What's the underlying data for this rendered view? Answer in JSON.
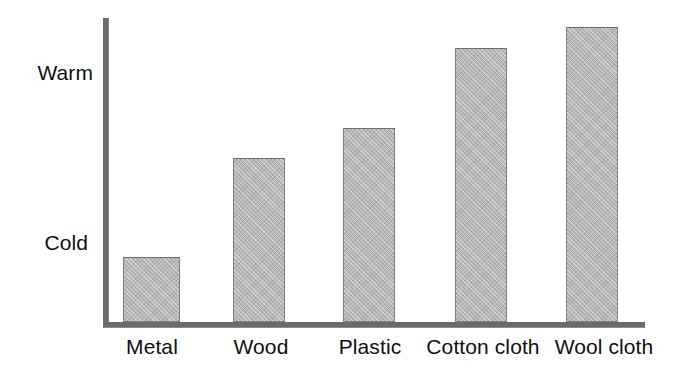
{
  "figure": {
    "background_color": "#ffffff",
    "axis_color": "#6b6b6b",
    "bar_fill_color": "#b6b6b6",
    "bar_border_color": "#7f7f7f",
    "text_color": "#101010"
  },
  "chart_data": {
    "type": "bar",
    "title": "",
    "xlabel": "",
    "ylabel": "",
    "categories": [
      "Metal",
      "Wood",
      "Plastic",
      "Cotton cloth",
      "Wool cloth"
    ],
    "values": [
      65,
      164,
      194,
      274,
      295
    ],
    "value_unit": "relative warmth (pixel bar height)",
    "ylim": [
      0,
      309
    ],
    "y_tick_labels": [
      "Cold",
      "Warm"
    ],
    "y_tick_positions": [
      65,
      253
    ],
    "grid": false,
    "legend": null,
    "annotations": [],
    "bars": [
      {
        "category": "Metal",
        "value": 65,
        "left": 123,
        "width": 57,
        "top": 257
      },
      {
        "category": "Wood",
        "value": 164,
        "left": 233,
        "width": 52,
        "top": 158
      },
      {
        "category": "Plastic",
        "value": 194,
        "left": 343,
        "width": 52,
        "top": 128
      },
      {
        "category": "Cotton cloth",
        "value": 274,
        "left": 455,
        "width": 52,
        "top": 48
      },
      {
        "category": "Wool cloth",
        "value": 295,
        "left": 566,
        "width": 52,
        "top": 27
      }
    ],
    "x_label_positions": [
      {
        "label": "Metal",
        "left": 113,
        "width": 78
      },
      {
        "label": "Wood",
        "left": 222,
        "width": 78
      },
      {
        "label": "Plastic",
        "left": 330,
        "width": 80
      },
      {
        "label": "Cotton cloth",
        "left": 421,
        "width": 124
      },
      {
        "label": "Wool cloth",
        "left": 545,
        "width": 118
      }
    ]
  },
  "y_axis": {
    "warm_label": "Warm",
    "cold_label": "Cold"
  }
}
